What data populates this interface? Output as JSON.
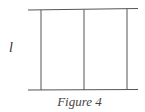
{
  "figure": {
    "caption": "Figure 4",
    "length_label": "l",
    "line_color": "#555555",
    "top_line": {
      "x1": 28,
      "y1": 10,
      "x2": 138,
      "y2": 8.5
    },
    "bottom_line": {
      "x1": 28,
      "y1": 90,
      "x2": 138,
      "y2": 89.5
    },
    "vertical_lines": [
      {
        "x": 41,
        "y1": 10,
        "y2": 90
      },
      {
        "x": 84,
        "y1": 9.5,
        "y2": 90
      },
      {
        "x": 127,
        "y1": 9,
        "y2": 89.5
      }
    ]
  }
}
